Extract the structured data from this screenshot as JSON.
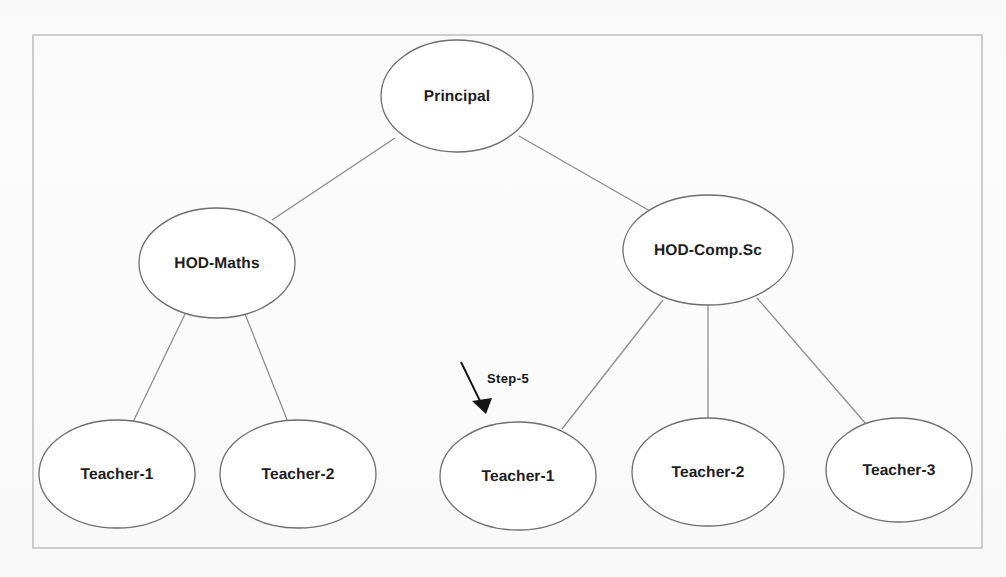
{
  "figure": {
    "type": "org-hierarchy-tree",
    "border": {
      "x": 33,
      "y": 35,
      "width": 949,
      "height": 513,
      "color": "#b9b9bb"
    },
    "background_color": "#fcfcfc",
    "node_stroke_color": "#6e6e70",
    "node_fill_color": "#ffffff",
    "edge_color": "#8b8b8d"
  },
  "nodes": [
    {
      "id": "principal",
      "label": "Principal",
      "cx": 457,
      "cy": 96,
      "rx": 76,
      "ry": 56
    },
    {
      "id": "hod-maths",
      "label": "HOD-Maths",
      "cx": 217,
      "cy": 263,
      "rx": 78,
      "ry": 55
    },
    {
      "id": "hod-comp-sc",
      "label": "HOD-Comp.Sc",
      "cx": 708,
      "cy": 250,
      "rx": 85,
      "ry": 55
    },
    {
      "id": "teacher-m1",
      "label": "Teacher-1",
      "cx": 117,
      "cy": 474,
      "rx": 78,
      "ry": 54
    },
    {
      "id": "teacher-m2",
      "label": "Teacher-2",
      "cx": 298,
      "cy": 474,
      "rx": 78,
      "ry": 54
    },
    {
      "id": "teacher-c1",
      "label": "Teacher-1",
      "cx": 518,
      "cy": 476,
      "rx": 78,
      "ry": 54
    },
    {
      "id": "teacher-c2",
      "label": "Teacher-2",
      "cx": 708,
      "cy": 472,
      "rx": 76,
      "ry": 54
    },
    {
      "id": "teacher-c3",
      "label": "Teacher-3",
      "cx": 899,
      "cy": 470,
      "rx": 73,
      "ry": 52
    }
  ],
  "edges": [
    {
      "id": "principal-to-hod-maths",
      "x1": 395,
      "y1": 138,
      "x2": 272,
      "y2": 220
    },
    {
      "id": "principal-to-hod-comp-sc",
      "x1": 519,
      "y1": 136,
      "x2": 650,
      "y2": 211
    },
    {
      "id": "hod-maths-to-teacher-m1",
      "x1": 185,
      "y1": 314,
      "x2": 133,
      "y2": 422
    },
    {
      "id": "hod-maths-to-teacher-m2",
      "x1": 245,
      "y1": 314,
      "x2": 288,
      "y2": 422
    },
    {
      "id": "hod-comp-sc-to-teacher-c1",
      "x1": 663,
      "y1": 300,
      "x2": 562,
      "y2": 429
    },
    {
      "id": "hod-comp-sc-to-teacher-c2",
      "x1": 708,
      "y1": 305,
      "x2": 708,
      "y2": 419
    },
    {
      "id": "hod-comp-sc-to-teacher-c3",
      "x1": 757,
      "y1": 298,
      "x2": 866,
      "y2": 424
    }
  ],
  "annotation": {
    "label": "Step-5",
    "label_x": 508,
    "label_y": 378,
    "arrow": {
      "x1": 461,
      "y1": 362,
      "x2": 485,
      "y2": 412
    },
    "color": "#141414"
  }
}
